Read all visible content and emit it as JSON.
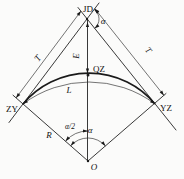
{
  "colors": {
    "ink": "#1a1a1a",
    "background": "#fbfbfa"
  },
  "diagram": {
    "kind": "circular-curve-geometry",
    "points": {
      "intersection": "JD",
      "curve_mid": "QZ",
      "curve_start": "ZY",
      "curve_end": "YZ",
      "circle_center": "O"
    },
    "dimensions": {
      "tangent_left": "T",
      "tangent_right": "T",
      "external_distance": "E",
      "curve_length": "L",
      "radius": "R"
    },
    "angles": {
      "deflection_at_jd": "α",
      "central": "α",
      "half_central": "α/2"
    }
  }
}
